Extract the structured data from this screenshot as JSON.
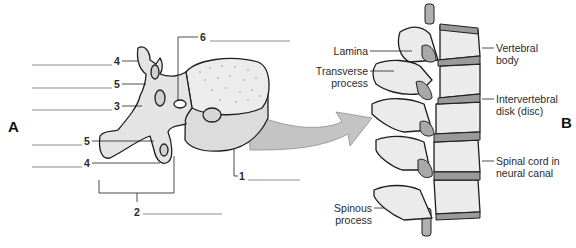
{
  "panels": {
    "a": "A",
    "b": "B"
  },
  "panel_a": {
    "description": "Superior-lateral view of a single vertebra with numbered blank labels",
    "labels": [
      {
        "number": "4",
        "answer_blank": ""
      },
      {
        "number": "5",
        "answer_blank": ""
      },
      {
        "number": "3",
        "answer_blank": ""
      },
      {
        "number": "5",
        "answer_blank": ""
      },
      {
        "number": "4",
        "answer_blank": ""
      },
      {
        "number": "6",
        "answer_blank": ""
      },
      {
        "number": "1",
        "answer_blank": ""
      },
      {
        "number": "2",
        "answer_blank": ""
      }
    ]
  },
  "panel_b": {
    "description": "Lateral view of a section of the vertebral column",
    "labels": {
      "lamina": "Lamina",
      "transverse_1": "Transverse",
      "transverse_2": "process",
      "vertebral_1": "Vertebral",
      "vertebral_2": "body",
      "disk_1": "Intervertebral",
      "disk_2": "disk (disc)",
      "cord_1": "Spinal cord in",
      "cord_2": "neural canal",
      "spinous_1": "Spinous",
      "spinous_2": "process"
    }
  },
  "colors": {
    "bone": "#e4e4e4",
    "bone_shade": "#cfcfcf",
    "disc": "#9a9a9a",
    "arrow": "#c4c4c4",
    "outline": "#1e1e1e",
    "leader": "#8a8a8a"
  }
}
